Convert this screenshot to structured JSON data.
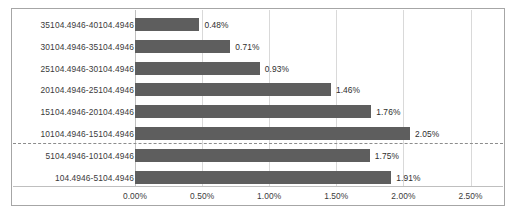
{
  "chart_data": {
    "type": "bar",
    "orientation": "horizontal",
    "title": "",
    "subtitle": "",
    "xlabel": "",
    "ylabel": "",
    "grid": true,
    "legend": false,
    "legend_position": "none",
    "xlim": [
      0,
      2.5
    ],
    "xtick_labels": [
      "0.00%",
      "0.50%",
      "1.00%",
      "1.50%",
      "2.00%",
      "2.50%"
    ],
    "xticks": [
      0,
      0.5,
      1.0,
      1.5,
      2.0,
      2.5
    ],
    "bar_color": "#5e5e5e",
    "gridline_color": "#d9d9d9",
    "border_color": "#a6a6a6",
    "separator": {
      "after_category_index": 5,
      "style": "dashed",
      "color": "#8c8c8c"
    },
    "categories": [
      "35104.4946-40104.4946",
      "30104.4946-35104.4946",
      "25104.4946-30104.4946",
      "20104.4946-25104.4946",
      "15104.4946-20104.4946",
      "10104.4946-15104.4946",
      "5104.4946-10104.4946",
      "104.4946-5104.4946"
    ],
    "values": [
      0.48,
      0.71,
      0.93,
      1.46,
      1.76,
      2.05,
      1.75,
      1.91
    ],
    "value_labels": [
      "0.48%",
      "0.71%",
      "0.93%",
      "1.46%",
      "1.76%",
      "2.05%",
      "1.75%",
      "1.91%"
    ]
  }
}
